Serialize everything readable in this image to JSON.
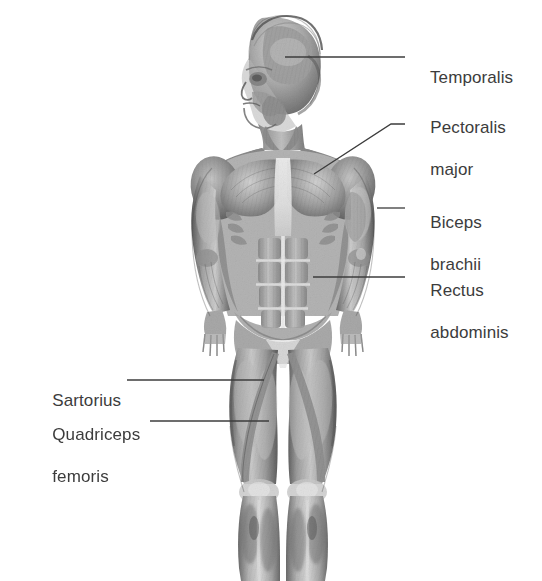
{
  "figure": {
    "view": "anterior",
    "style": "grayscale pencil/airbrush anatomical illustration",
    "background_color": "#ffffff",
    "ink_color": "#3c3c3c",
    "body_crop": "head to mid-shin (feet not shown)"
  },
  "labels": [
    {
      "id": "temporalis",
      "text": "Temporalis",
      "lines": [
        "Temporalis"
      ],
      "side": "right",
      "text_x": 411,
      "text_y": 46,
      "leader": {
        "x1": 285,
        "y1": 57,
        "x2": 405,
        "y2": 57
      }
    },
    {
      "id": "pectoralis-major",
      "text": "Pectoralis major",
      "lines": [
        "Pectoralis",
        "major"
      ],
      "side": "right",
      "text_x": 411,
      "text_y": 96,
      "leader": {
        "x1": 314,
        "y1": 174,
        "x2": 391,
        "y2": 124,
        "x3": 405,
        "y3": 124
      }
    },
    {
      "id": "biceps-brachii",
      "text": "Biceps brachii",
      "lines": [
        "Biceps",
        "brachii"
      ],
      "side": "right",
      "text_x": 411,
      "text_y": 191,
      "leader": {
        "x1": 377,
        "y1": 208,
        "x2": 405,
        "y2": 208
      }
    },
    {
      "id": "rectus-abdominis",
      "text": "Rectus abdominis",
      "lines": [
        "Rectus",
        "abdominis"
      ],
      "side": "right",
      "text_x": 411,
      "text_y": 259,
      "leader": {
        "x1": 313,
        "y1": 277,
        "x2": 405,
        "y2": 277
      }
    },
    {
      "id": "sartorius",
      "text": "Sartorius",
      "lines": [
        "Sartorius"
      ],
      "side": "left",
      "text_x": 33,
      "text_y": 369,
      "leader": {
        "x1": 127,
        "y1": 380,
        "x2": 264,
        "y2": 380
      }
    },
    {
      "id": "quadriceps-femoris",
      "text": "Quadriceps femoris",
      "lines": [
        "Quadriceps",
        "femoris"
      ],
      "side": "left",
      "text_x": 33,
      "text_y": 403,
      "leader": {
        "x1": 150,
        "y1": 421,
        "x2": 269,
        "y2": 421
      }
    }
  ],
  "label_text": {
    "temporalis_l1": "Temporalis",
    "pectoralis_l1": "Pectoralis",
    "pectoralis_l2": "major",
    "biceps_l1": "Biceps",
    "biceps_l2": "brachii",
    "rectus_l1": "Rectus",
    "rectus_l2": "abdominis",
    "sartorius_l1": "Sartorius",
    "quadriceps_l1": "Quadriceps",
    "quadriceps_l2": "femoris"
  }
}
